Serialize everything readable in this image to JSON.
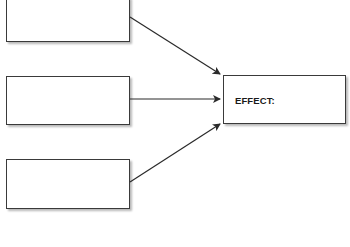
{
  "diagram": {
    "type": "cause-effect",
    "causes": [
      {
        "label": ""
      },
      {
        "label": ""
      },
      {
        "label": ""
      }
    ],
    "effect": {
      "label": "EFFECT:"
    }
  },
  "colors": {
    "stroke": "#3a3a3a",
    "text": "#1a1a1a",
    "background": "#ffffff"
  }
}
